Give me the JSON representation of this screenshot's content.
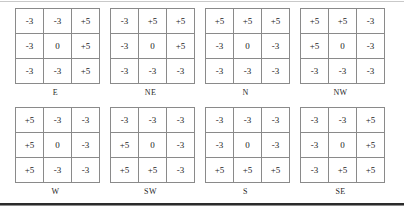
{
  "figure": {
    "name": "compass-direction-convolution-kernels",
    "row_count": 2,
    "columns_per_row": 4
  },
  "kernels": [
    {
      "label": "E",
      "rows": [
        [
          "-3",
          "-3",
          "+5"
        ],
        [
          "-3",
          "0",
          "+5"
        ],
        [
          "-3",
          "-3",
          "+5"
        ]
      ]
    },
    {
      "label": "NE",
      "rows": [
        [
          "-3",
          "+5",
          "+5"
        ],
        [
          "-3",
          "0",
          "+5"
        ],
        [
          "-3",
          "-3",
          "-3"
        ]
      ]
    },
    {
      "label": "N",
      "rows": [
        [
          "+5",
          "+5",
          "+5"
        ],
        [
          "-3",
          "0",
          "-3"
        ],
        [
          "-3",
          "-3",
          "-3"
        ]
      ]
    },
    {
      "label": "NW",
      "rows": [
        [
          "+5",
          "+5",
          "-3"
        ],
        [
          "+5",
          "0",
          "-3"
        ],
        [
          "-3",
          "-3",
          "-3"
        ]
      ]
    },
    {
      "label": "W",
      "rows": [
        [
          "+5",
          "-3",
          "-3"
        ],
        [
          "+5",
          "0",
          "-3"
        ],
        [
          "+5",
          "-3",
          "-3"
        ]
      ]
    },
    {
      "label": "SW",
      "rows": [
        [
          "-3",
          "-3",
          "-3"
        ],
        [
          "+5",
          "0",
          "-3"
        ],
        [
          "+5",
          "+5",
          "-3"
        ]
      ]
    },
    {
      "label": "S",
      "rows": [
        [
          "-3",
          "-3",
          "-3"
        ],
        [
          "-3",
          "0",
          "-3"
        ],
        [
          "+5",
          "+5",
          "+5"
        ]
      ]
    },
    {
      "label": "SE",
      "rows": [
        [
          "-3",
          "-3",
          "+5"
        ],
        [
          "-3",
          "0",
          "+5"
        ],
        [
          "-3",
          "+5",
          "+5"
        ]
      ]
    }
  ],
  "colors": {
    "cell_border": "#8a8a8a",
    "text": "#232323",
    "rule_top": "#c9c9c9",
    "rule_bottom": "#2b2b2b",
    "background": "#ffffff"
  }
}
